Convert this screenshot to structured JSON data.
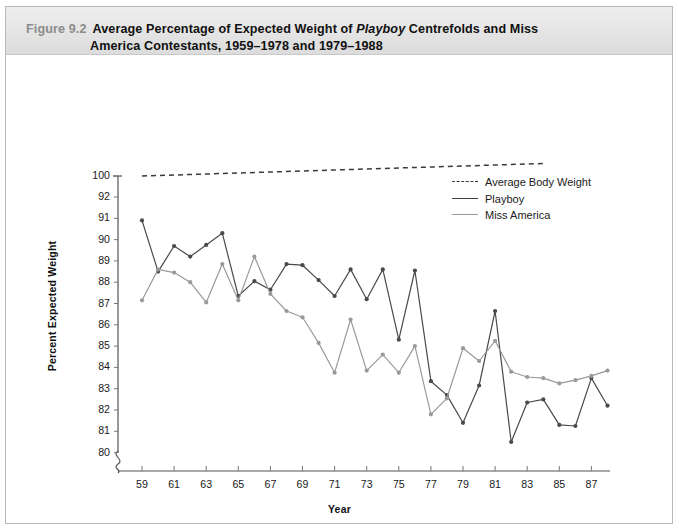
{
  "figure": {
    "number": "Figure 9.2",
    "caption_line1_a": "Average Percentage of Expected Weight of ",
    "caption_italic": "Playboy",
    "caption_line1_b": " Centrefolds and Miss",
    "caption_line2": "America Contestants, 1959–1978 and 1979–1988"
  },
  "chart_data": {
    "type": "line",
    "title": "Average Percentage of Expected Weight of Playboy Centrefolds and Miss America Contestants, 1959–1978 and 1979–1988",
    "xlabel": "Year",
    "ylabel": "Percent Expected Weight",
    "grid": false,
    "legend_position": "upper-right-inside",
    "axis_break_y": true,
    "ylim": [
      79.3,
      100
    ],
    "xlim": [
      58.3,
      88.7
    ],
    "ytick_labels": [
      "100",
      "92",
      "91",
      "90",
      "89",
      "88",
      "87",
      "86",
      "85",
      "84",
      "83",
      "82",
      "81",
      "80"
    ],
    "ytick_values": [
      100,
      92,
      91,
      90,
      89,
      88,
      87,
      86,
      85,
      84,
      83,
      82,
      81,
      80
    ],
    "xtick_labels": [
      "59",
      "61",
      "63",
      "65",
      "67",
      "69",
      "71",
      "73",
      "75",
      "77",
      "79",
      "81",
      "83",
      "85",
      "87"
    ],
    "xtick_values": [
      59,
      61,
      63,
      65,
      67,
      69,
      71,
      73,
      75,
      77,
      79,
      81,
      83,
      85,
      87
    ],
    "series": [
      {
        "name": "Average Body Weight",
        "style": "dashed",
        "color": "#3a3a3a",
        "markers": false,
        "x": [
          59,
          84
        ],
        "values": [
          100,
          104.8
        ]
      },
      {
        "name": "Playboy",
        "style": "solid",
        "color": "#4a4a4a",
        "markers": true,
        "x": [
          59,
          60,
          61,
          62,
          63,
          64,
          65,
          66,
          67,
          68,
          69,
          70,
          71,
          72,
          73,
          74,
          75,
          76,
          77,
          78,
          79,
          80,
          81,
          82,
          83,
          84,
          85,
          86,
          87,
          88
        ],
        "values": [
          90.9,
          88.5,
          89.7,
          89.2,
          89.75,
          90.3,
          87.35,
          88.05,
          87.65,
          88.85,
          88.8,
          88.1,
          87.35,
          88.6,
          87.2,
          88.6,
          85.3,
          88.55,
          83.35,
          82.7,
          81.4,
          83.15,
          86.65,
          80.5,
          82.35,
          82.5,
          81.3,
          81.25,
          83.5,
          82.2
        ]
      },
      {
        "name": "Miss America",
        "style": "solid",
        "color": "#9a9a9a",
        "markers": true,
        "x": [
          59,
          60,
          61,
          62,
          63,
          64,
          65,
          66,
          67,
          68,
          69,
          70,
          71,
          72,
          73,
          74,
          75,
          76,
          77,
          78,
          79,
          80,
          81,
          82,
          83,
          84,
          85,
          86,
          87,
          88
        ],
        "values": [
          87.15,
          88.6,
          88.45,
          88.0,
          87.05,
          88.85,
          87.15,
          89.2,
          87.45,
          86.65,
          86.35,
          85.15,
          83.75,
          86.25,
          83.85,
          84.6,
          83.75,
          85.0,
          81.8,
          82.55,
          84.9,
          84.3,
          85.25,
          83.8,
          83.55,
          83.5,
          83.25,
          83.4,
          83.6,
          83.85
        ]
      }
    ]
  },
  "legend": {
    "items": [
      {
        "label": "Average Body Weight",
        "swatch": "dashed-dark"
      },
      {
        "label": "Playboy",
        "swatch": "solid-dark"
      },
      {
        "label": "Miss America",
        "swatch": "solid-gray"
      }
    ]
  }
}
